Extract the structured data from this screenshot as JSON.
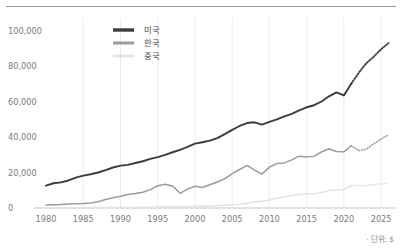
{
  "footnote": "· 단위: $",
  "colors": {
    "usa": "#3c3c3c",
    "korea": "#9b9b9b",
    "china": "#e3e3e3",
    "grid": "#ededed",
    "axis": "#d8d8d8",
    "tick_text": "#7a7a7a",
    "legend_text": "#4a4a4a",
    "rule": "#9a9a9a",
    "background": "#ffffff"
  },
  "legend": {
    "position": "top-center",
    "items": [
      {
        "label": "미국",
        "color": "#3c3c3c",
        "width": 3.4
      },
      {
        "label": "한국",
        "color": "#9b9b9b",
        "width": 3.0
      },
      {
        "label": "중국",
        "color": "#e3e3e3",
        "width": 2.6
      }
    ]
  },
  "chart_data": {
    "type": "line",
    "title": "",
    "subtitle": "",
    "xlabel": "",
    "ylabel": "",
    "xlim": [
      1980,
      2027
    ],
    "ylim": [
      0,
      105000
    ],
    "grid": "vertical",
    "legend_position": "top-center",
    "unit_note": "· 단위: $",
    "ytick_labels": [
      "0",
      "20,000",
      "40,000",
      "60,000",
      "80,000",
      "100,000"
    ],
    "yticks": [
      0,
      20000,
      40000,
      60000,
      80000,
      100000
    ],
    "xtick_labels": [
      "1980",
      "1985",
      "1990",
      "1995",
      "2000",
      "2005",
      "2010",
      "2015",
      "2020",
      "2025"
    ],
    "xticks": [
      1980,
      1985,
      1990,
      1995,
      2000,
      2005,
      2010,
      2015,
      2020,
      2025
    ],
    "forecast_start_year": 2021,
    "x": [
      1980,
      1981,
      1982,
      1983,
      1984,
      1985,
      1986,
      1987,
      1988,
      1989,
      1990,
      1991,
      1992,
      1993,
      1994,
      1995,
      1996,
      1997,
      1998,
      1999,
      2000,
      2001,
      2002,
      2003,
      2004,
      2005,
      2006,
      2007,
      2008,
      2009,
      2010,
      2011,
      2012,
      2013,
      2014,
      2015,
      2016,
      2017,
      2018,
      2019,
      2020,
      2021,
      2022,
      2023,
      2024,
      2025,
      2026
    ],
    "series": [
      {
        "name": "미국",
        "color": "#3c3c3c",
        "values": [
          12575,
          13976,
          14434,
          15544,
          17121,
          18237,
          19071,
          20039,
          21417,
          22857,
          23889,
          24342,
          25419,
          26387,
          27695,
          28691,
          29968,
          31459,
          32854,
          34514,
          36330,
          37134,
          38023,
          39496,
          41713,
          44115,
          46299,
          47976,
          48383,
          47100,
          48586,
          50008,
          51737,
          53108,
          55050,
          56863,
          58021,
          60110,
          63064,
          65280,
          63530,
          70248,
          76343,
          81695,
          85373,
          89678,
          93100
        ],
        "style": "solid-then-dotted"
      },
      {
        "name": "한국",
        "color": "#9b9b9b",
        "values": [
          1715,
          1883,
          1995,
          2209,
          2414,
          2482,
          2835,
          3555,
          4749,
          5818,
          6610,
          7637,
          8126,
          8884,
          10385,
          12565,
          13403,
          12398,
          8282,
          10672,
          12257,
          11561,
          13165,
          14673,
          16496,
          19403,
          21743,
          24086,
          21350,
          19152,
          23087,
          25096,
          25467,
          27183,
          29250,
          28732,
          29289,
          31616,
          33447,
          31902,
          31721,
          35144,
          32410,
          33147,
          36132,
          39000,
          41300
        ],
        "style": "solid-then-dotted"
      },
      {
        "name": "중국",
        "color": "#e3e3e3",
        "values": [
          195,
          197,
          204,
          225,
          250,
          294,
          282,
          251,
          284,
          311,
          317,
          333,
          366,
          377,
          473,
          609,
          709,
          781,
          828,
          873,
          959,
          1053,
          1148,
          1288,
          1508,
          1753,
          2099,
          2693,
          3468,
          3832,
          4550,
          5614,
          6301,
          7051,
          7651,
          8034,
          8063,
          8760,
          9905,
          10144,
          10409,
          12617,
          12720,
          12614,
          13100,
          13600,
          14100
        ],
        "style": "solid-then-dotted"
      }
    ]
  }
}
